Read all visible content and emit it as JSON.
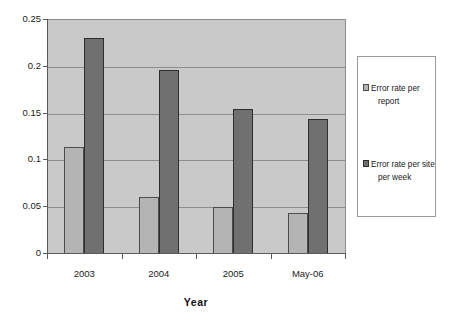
{
  "chart_data": {
    "type": "bar",
    "title": "",
    "subtitle": "",
    "xlabel": "Year",
    "ylabel": "",
    "categories": [
      "2003",
      "2004",
      "2005",
      "May-06"
    ],
    "series": [
      {
        "name": "Error rate per report",
        "name_line1": "Error rate per",
        "name_line2": "report",
        "color": "#b4b4b4",
        "values": [
          0.113,
          0.06,
          0.049,
          0.043
        ]
      },
      {
        "name": "Error rate per site per week",
        "name_line1": "Error rate per site",
        "name_line2": "per week",
        "color": "#707070",
        "values": [
          0.23,
          0.195,
          0.154,
          0.143
        ]
      }
    ],
    "ylim": [
      0,
      0.25
    ],
    "yticks": [
      0,
      0.05,
      0.1,
      0.15,
      0.2,
      0.25
    ],
    "ytick_labels": [
      "0",
      "0.05",
      "0.1",
      "0.15",
      "0.2",
      "0.25"
    ],
    "grid": true,
    "grid_axis": "y",
    "legend_position": "right",
    "plot_background": "#c9c9c9",
    "figure_background": "#ffffff"
  }
}
